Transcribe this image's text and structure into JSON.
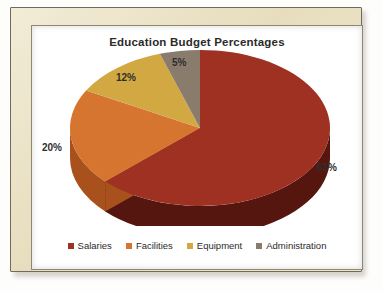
{
  "frame": {
    "mat_color": "#ece3c9",
    "page_color": "#ffffff"
  },
  "chart_data": {
    "type": "pie",
    "title": "Education Budget Percentages",
    "xlabel": "",
    "ylabel": "",
    "three_d": true,
    "start_angle_deg": 0,
    "direction": "clockwise",
    "legend_position": "bottom",
    "grid": false,
    "categories": [
      "Salaries",
      "Facilities",
      "Equipment",
      "Administration"
    ],
    "values": [
      63,
      20,
      12,
      5
    ],
    "value_labels": [
      "63%",
      "20%",
      "12%",
      "5%"
    ],
    "colors": [
      "#9E3122",
      "#D5752F",
      "#D2A843",
      "#8A7C6C"
    ],
    "side_colors": [
      "#551610",
      "#A8511D",
      "#A7822F",
      "#665B4F"
    ],
    "slices": [
      {
        "name": "Salaries",
        "value": 63,
        "label": "63%",
        "color": "#9E3122",
        "side_color": "#551610"
      },
      {
        "name": "Facilities",
        "value": 20,
        "label": "20%",
        "color": "#D5752F",
        "side_color": "#A8511D"
      },
      {
        "name": "Equipment",
        "value": 12,
        "label": "12%",
        "color": "#D2A843",
        "side_color": "#A7822F"
      },
      {
        "name": "Administration",
        "value": 5,
        "label": "5%",
        "color": "#8A7C6C",
        "side_color": "#665B4F"
      }
    ]
  },
  "legend": {
    "items": [
      {
        "label": "Salaries",
        "color": "#9E3122"
      },
      {
        "label": "Facilities",
        "color": "#D5752F"
      },
      {
        "label": "Equipment",
        "color": "#D2A843"
      },
      {
        "label": "Administration",
        "color": "#8A7C6C"
      }
    ]
  }
}
